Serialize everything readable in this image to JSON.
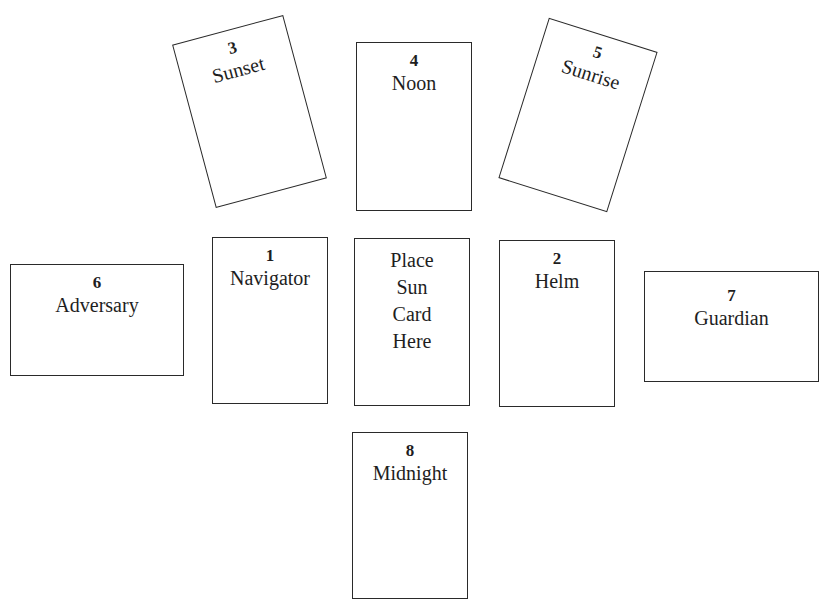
{
  "spread": {
    "cards": [
      {
        "position": "1",
        "label": "Navigator"
      },
      {
        "position": "2",
        "label": "Helm"
      },
      {
        "position": "3",
        "label": "Sunset"
      },
      {
        "position": "4",
        "label": "Noon"
      },
      {
        "position": "5",
        "label": "Sunrise"
      },
      {
        "position": "6",
        "label": "Adversary"
      },
      {
        "position": "7",
        "label": "Guardian"
      },
      {
        "position": "8",
        "label": "Midnight"
      }
    ],
    "center": {
      "lines": [
        "Place",
        "Sun",
        "Card",
        "Here"
      ]
    }
  }
}
